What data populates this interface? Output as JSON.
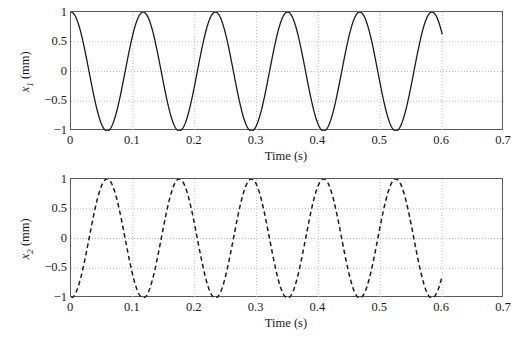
{
  "figure": {
    "background": "#ffffff",
    "axis_color": "#5a5a5a",
    "grid_color": "#bfbfbf",
    "curve_color": "#1a1a1a"
  },
  "panels": [
    {
      "id": "top",
      "ylabel_var": "x",
      "ylabel_sub": "1",
      "ylabel_units": "(mm)",
      "xlabel": "Time (s)",
      "xticks": [
        "0",
        "0.1",
        "0.2",
        "0.3",
        "0.4",
        "0.5",
        "0.6",
        "0.7"
      ],
      "yticks": [
        "1",
        "0.5",
        "0",
        "−0.5",
        "−1"
      ]
    },
    {
      "id": "bottom",
      "ylabel_var": "x",
      "ylabel_sub": "2",
      "ylabel_units": "(mm)",
      "xlabel": "Time (s)",
      "xticks": [
        "0",
        "0.1",
        "0.2",
        "0.3",
        "0.4",
        "0.5",
        "0.6",
        "0.7"
      ],
      "yticks": [
        "1",
        "0.5",
        "0",
        "−0.5",
        "−1"
      ]
    }
  ],
  "chart_data": [
    {
      "type": "line",
      "title": "",
      "xlabel": "Time (s)",
      "ylabel": "x1 (mm)",
      "xlim": [
        0,
        0.7
      ],
      "ylim": [
        -1,
        1
      ],
      "xticks": [
        0,
        0.1,
        0.2,
        0.3,
        0.4,
        0.5,
        0.6,
        0.7
      ],
      "yticks": [
        -1,
        -0.5,
        0,
        0.5,
        1
      ],
      "xtick_labels": [
        "0",
        "0.1",
        "0.2",
        "0.3",
        "0.4",
        "0.5",
        "0.6",
        "0.7"
      ],
      "ytick_labels": [
        "−1",
        "−0.5",
        "0",
        "0.5",
        "1"
      ],
      "grid": true,
      "legend": "none",
      "series": [
        {
          "name": "x1",
          "linestyle": "solid",
          "color": "#1a1a1a",
          "linewidth": 1.3,
          "waveform": "cosine",
          "amplitude": 1.0,
          "period_s": 0.1167,
          "frequency_hz": 8.57,
          "phase_deg": 0,
          "t_start": 0.0,
          "t_end": 0.6,
          "description": "x1(t) = 1.0 * cos(2*pi*t/0.1167) mm; starts at +1 mm, 5 full cycles plus a partial cycle, ends near +0.45 mm at t = 0.6 s",
          "peaks_t": [
            0.0,
            0.1167,
            0.2333,
            0.35,
            0.4667,
            0.5833
          ],
          "troughs_t": [
            0.0583,
            0.175,
            0.2917,
            0.4083,
            0.525
          ]
        }
      ]
    },
    {
      "type": "line",
      "title": "",
      "xlabel": "Time (s)",
      "ylabel": "x2 (mm)",
      "xlim": [
        0,
        0.7
      ],
      "ylim": [
        -1,
        1
      ],
      "xticks": [
        0,
        0.1,
        0.2,
        0.3,
        0.4,
        0.5,
        0.6,
        0.7
      ],
      "yticks": [
        -1,
        -0.5,
        0,
        0.5,
        1
      ],
      "xtick_labels": [
        "0",
        "0.1",
        "0.2",
        "0.3",
        "0.4",
        "0.5",
        "0.6",
        "0.7"
      ],
      "ytick_labels": [
        "−1",
        "−0.5",
        "0",
        "0.5",
        "1"
      ],
      "grid": true,
      "legend": "none",
      "series": [
        {
          "name": "x2",
          "linestyle": "dashed",
          "color": "#1a1a1a",
          "linewidth": 1.5,
          "waveform": "negative-cosine",
          "amplitude": 1.0,
          "period_s": 0.1167,
          "frequency_hz": 8.57,
          "phase_deg": 180,
          "t_start": 0.0,
          "t_end": 0.6,
          "description": "x2(t) = -1.0 * cos(2*pi*t/0.1167) mm; starts at -1 mm, 180 deg out of phase with x1, ends near -0.45 mm at t = 0.6 s",
          "peaks_t": [
            0.0583,
            0.175,
            0.2917,
            0.4083,
            0.525
          ],
          "troughs_t": [
            0.0,
            0.1167,
            0.2333,
            0.35,
            0.4667,
            0.5833
          ]
        }
      ]
    }
  ]
}
